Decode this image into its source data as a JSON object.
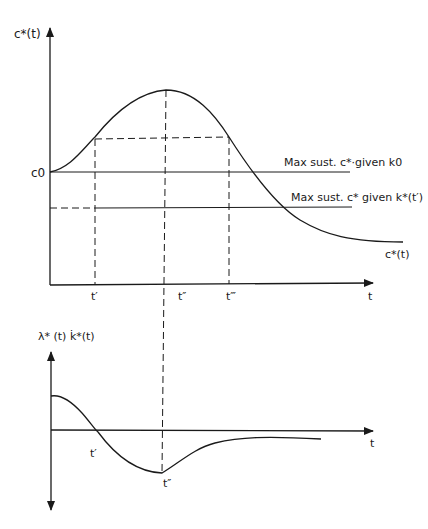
{
  "top_panel": {
    "y_axis_label": "c*(t)",
    "x_axis_label": "t",
    "c0_label": "c0",
    "curve_label": "c*(t)",
    "ref_line_1_label": "Max sust. c*·given k0",
    "ref_line_2_label": "Max sust. c* given k*(t′)",
    "tick_labels": [
      "t′",
      "t″",
      "t‴"
    ]
  },
  "bottom_panel": {
    "y_axis_label": "λ* (t) k̇*(t)",
    "x_axis_label": "t",
    "tick_labels": [
      "t′",
      "t″"
    ]
  },
  "colors": {
    "ink": "#1a1a1a",
    "background": "#ffffff"
  }
}
